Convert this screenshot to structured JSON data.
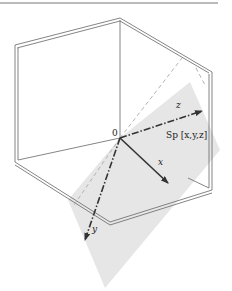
{
  "figure": {
    "type": "3D coordinate frame inside a room corner (box) with a shaded plane",
    "origin_label": "0",
    "axes": [
      {
        "name": "x",
        "label": "x",
        "style": "solid"
      },
      {
        "name": "y",
        "label": "y",
        "style": "dash-dot"
      },
      {
        "name": "z",
        "label": "z",
        "style": "dash-dot"
      }
    ],
    "plane_label": "Sp [x,y,z]",
    "colors": {
      "line": "#555555",
      "arrow": "#333333",
      "plane_fill": "#e6e6e6",
      "dashed_guides": "#aaaaaa",
      "background": "#ffffff"
    }
  }
}
